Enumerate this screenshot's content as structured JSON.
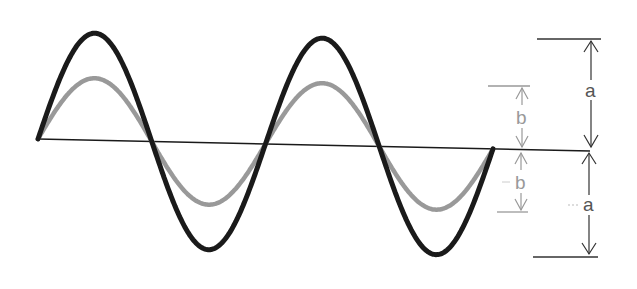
{
  "diagram": {
    "type": "wave-amplitude-comparison",
    "axis": {
      "x1": 38,
      "y1": 139,
      "x2": 590,
      "y2": 151,
      "color": "#1a1a1a"
    },
    "waves": [
      {
        "name": "large-wave",
        "amplitude_label": "a",
        "amplitude_px": 107,
        "color": "#1a1a1a",
        "stroke": 5
      },
      {
        "name": "small-wave",
        "amplitude_label": "b",
        "amplitude_px": 62,
        "color": "#999999",
        "stroke": 4.5
      }
    ],
    "cycles": 2,
    "x_start": 38,
    "x_end": 493,
    "labels": {
      "a_upper": "a",
      "a_lower": "a",
      "b_upper": "b",
      "b_lower": "b"
    }
  }
}
